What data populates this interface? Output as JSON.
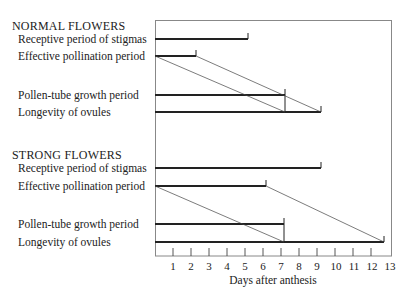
{
  "sections": [
    {
      "title": "NORMAL FLOWERS",
      "rows": [
        {
          "label": "Receptive period of stigmas",
          "end_day": 5.2
        },
        {
          "label": "Effective pollination period",
          "end_day": 2.3
        },
        {
          "label": "Pollen-tube growth period",
          "end_day": 7.2
        },
        {
          "label": "Longevity of ovules",
          "end_day": 9.2
        }
      ]
    },
    {
      "title": "STRONG FLOWERS",
      "rows": [
        {
          "label": "Receptive period of stigmas",
          "end_day": 9.2
        },
        {
          "label": "Effective pollination period",
          "end_day": 6.2
        },
        {
          "label": "Pollen-tube growth period",
          "end_day": 7.2
        },
        {
          "label": "Longevity of ovules",
          "end_day": 12.7
        }
      ]
    }
  ],
  "axis": {
    "title": "Days after anthesis",
    "ticks": [
      "1",
      "2",
      "3",
      "4",
      "5",
      "6",
      "7",
      "8",
      "9",
      "10",
      "11",
      "12",
      "13"
    ],
    "min": 0,
    "max": 13
  }
}
